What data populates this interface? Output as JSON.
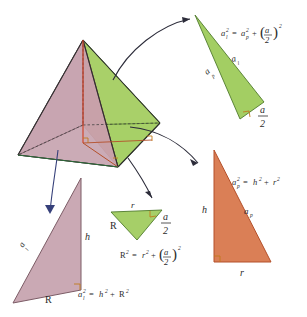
{
  "figure": {
    "colors": {
      "pink": "#c7a4b0",
      "pink_edge": "#7c5c66",
      "green": "#9ecb5b",
      "green_edge": "#4f7a2c",
      "orange": "#d8784d",
      "orange_edge": "#b4502a",
      "arrow": "#36407a",
      "arrow_dark": "#2c2c3a",
      "line": "#2e2e2e",
      "text": "#2b2b2b",
      "right_angle": "#c07a1e"
    }
  },
  "solid": {
    "name": "square-pyramid",
    "faces": [
      {
        "name": "lateral-face-left",
        "color": "#c7a4b0"
      },
      {
        "name": "lateral-face-right",
        "color": "#9ecb5b"
      },
      {
        "name": "apothem-cross-section",
        "color": "#d8784d"
      },
      {
        "name": "base-half",
        "color": "#9ecb5b"
      }
    ]
  },
  "triangles": {
    "green_slant": {
      "name": "lateral-face-triangle",
      "fill": "#9ecb5b",
      "sides": {
        "hypotenuse": "a",
        "leg_left": "a",
        "leg_bottom": "a"
      },
      "labels": {
        "hypotenuse": "a",
        "hypotenuse_sub": "l",
        "leg_left": "a",
        "leg_left_sub": "p",
        "base_num": "a",
        "base_den": "2"
      }
    },
    "orange_apothem": {
      "name": "apothem-triangle",
      "fill": "#d8784d",
      "labels": {
        "height": "h",
        "hypotenuse": "a",
        "hypotenuse_sub": "p",
        "base": "r"
      }
    },
    "pink_edge": {
      "name": "lateral-edge-triangle",
      "fill": "#c7a4b0",
      "labels": {
        "hypotenuse": "a",
        "hypotenuse_sub": "l",
        "height": "h",
        "base": "R"
      }
    },
    "small_green_base": {
      "name": "base-half-triangle",
      "fill": "#9ecb5b",
      "labels": {
        "top": "r",
        "left": "R",
        "right_num": "a",
        "right_den": "2"
      }
    }
  },
  "equations": {
    "slant": {
      "name": "slant-height-equation",
      "lhs_base": "a",
      "lhs_sub": "l",
      "lhs_exp": "2",
      "eq": "=",
      "t1_base": "a",
      "t1_sub": "p",
      "t1_exp": "2",
      "plus": "+",
      "frac_num": "a",
      "frac_den": "2",
      "frac_exp": "2"
    },
    "apothem": {
      "name": "apothem-equation",
      "lhs_base": "a",
      "lhs_sub": "p",
      "lhs_exp": "2",
      "eq": "=",
      "t1": "h",
      "t1_exp": "2",
      "plus": "+",
      "t2": "r",
      "t2_exp": "2"
    },
    "circumradius": {
      "name": "circumradius-equation",
      "lhs": "R",
      "lhs_exp": "2",
      "eq": "=",
      "t1": "r",
      "t1_exp": "2",
      "plus": "+",
      "frac_num": "a",
      "frac_den": "2",
      "frac_exp": "2"
    },
    "lateral_edge": {
      "name": "lateral-edge-equation",
      "lhs_base": "a",
      "lhs_sub": "l",
      "lhs_exp": "2",
      "eq": "=",
      "t1": "h",
      "t1_exp": "2",
      "plus": "+",
      "t2": "R",
      "t2_exp": "2"
    }
  },
  "arrows": [
    {
      "name": "arrow-to-slant-triangle"
    },
    {
      "name": "arrow-to-apothem-triangle"
    },
    {
      "name": "arrow-to-base-triangle"
    },
    {
      "name": "arrow-to-edge-triangle"
    }
  ]
}
